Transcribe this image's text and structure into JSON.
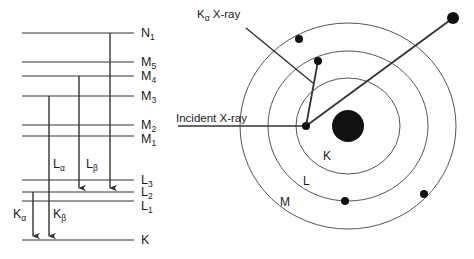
{
  "figure": {
    "type": "diagram"
  },
  "colors": {
    "line": "#333333",
    "shell_stroke": "#555555",
    "nucleus": "#111111",
    "electron": "#111111",
    "text": "#1a1a1a",
    "background": "#ffffff"
  },
  "energy_diagram": {
    "levels": [
      {
        "id": "N1",
        "letter": "N",
        "sub": "1",
        "y": 33
      },
      {
        "id": "M5",
        "letter": "M",
        "sub": "5",
        "y": 62
      },
      {
        "id": "M4",
        "letter": "M",
        "sub": "4",
        "y": 76
      },
      {
        "id": "M3",
        "letter": "M",
        "sub": "3",
        "y": 96
      },
      {
        "id": "M2",
        "letter": "M",
        "sub": "2",
        "y": 125
      },
      {
        "id": "M1",
        "letter": "M",
        "sub": "1",
        "y": 136
      },
      {
        "id": "L3",
        "letter": "L",
        "sub": "3",
        "y": 180
      },
      {
        "id": "L2",
        "letter": "L",
        "sub": "2",
        "y": 192
      },
      {
        "id": "L1",
        "letter": "L",
        "sub": "1",
        "y": 201
      },
      {
        "id": "K",
        "letter": "K",
        "sub": "",
        "y": 240
      }
    ],
    "line_x_start": 22,
    "line_x_end": 134,
    "label_x": 141,
    "transitions": [
      {
        "id": "K-alpha",
        "letter": "K",
        "sub": "α",
        "from": "L2",
        "to": "K",
        "x": 33,
        "label_x": 13,
        "label_y": 218
      },
      {
        "id": "K-beta",
        "letter": "K",
        "sub": "β",
        "from": "M3",
        "to": "K",
        "x": 49,
        "label_x": 53,
        "label_y": 218
      },
      {
        "id": "L-alpha",
        "letter": "L",
        "sub": "α",
        "from": "M4",
        "to": "L2",
        "x": 79,
        "label_x": 53,
        "label_y": 168
      },
      {
        "id": "L-beta",
        "letter": "L",
        "sub": "β",
        "from": "N1",
        "to": "L2",
        "x": 110,
        "label_x": 86,
        "label_y": 168
      }
    ]
  },
  "atom_diagram": {
    "center": {
      "x": 348,
      "y": 126
    },
    "nucleus_radius": 16,
    "shells": [
      {
        "id": "K",
        "label": "K",
        "rx": 52,
        "ry": 48,
        "label_x": 323,
        "label_y": 160
      },
      {
        "id": "L",
        "label": "L",
        "rx": 80,
        "ry": 75,
        "label_x": 303,
        "label_y": 185
      },
      {
        "id": "M",
        "label": "M",
        "rx": 108,
        "ry": 103,
        "label_x": 280,
        "label_y": 206
      }
    ],
    "electrons": [
      {
        "id": "electron-m-upper-left",
        "x": 299,
        "y": 39,
        "r": 4
      },
      {
        "id": "electron-l-upper",
        "x": 318,
        "y": 61,
        "r": 4
      },
      {
        "id": "electron-k-vacancy",
        "x": 306,
        "y": 126,
        "r": 4
      },
      {
        "id": "electron-l-lower",
        "x": 345,
        "y": 201,
        "r": 4
      },
      {
        "id": "electron-m-lower-right",
        "x": 424,
        "y": 194,
        "r": 4
      },
      {
        "id": "electron-ejected",
        "x": 453,
        "y": 18,
        "r": 6
      }
    ],
    "rays": {
      "incident": {
        "x1": 178,
        "y1": 126,
        "x2": 306,
        "y2": 126
      },
      "ejected": {
        "x1": 306,
        "y1": 126,
        "x2": 453,
        "y2": 18
      },
      "transition": {
        "x1": 318,
        "y1": 61,
        "x2": 306,
        "y2": 126
      }
    },
    "leader_kalpha": {
      "x1": 246,
      "y1": 28,
      "x2": 313,
      "y2": 83
    }
  },
  "annotations": {
    "kalpha_xray": {
      "letter": "K",
      "sub": "α",
      "rest": " X-ray",
      "x": 197,
      "y": 18
    },
    "incident_xray": {
      "text": "Incident X-ray",
      "x": 176,
      "y": 122
    }
  }
}
